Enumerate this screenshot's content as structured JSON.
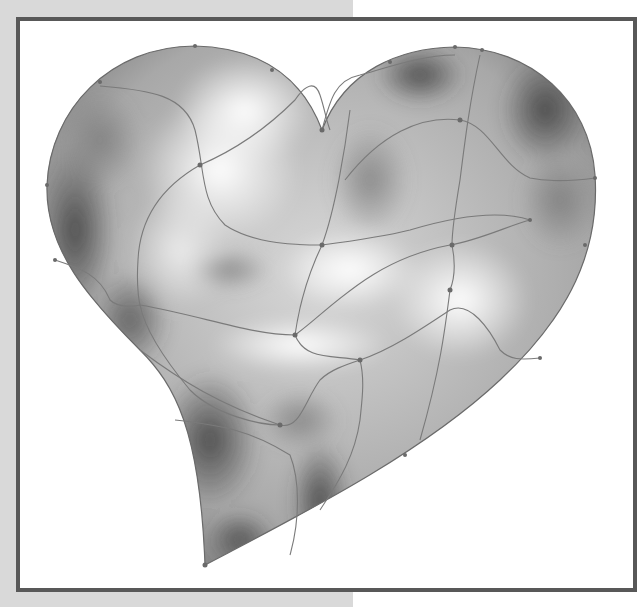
{
  "artwork": {
    "subject": "gradient mesh heart",
    "style": "grayscale mesh illustration",
    "colors": {
      "background_gray": "#d9d9d9",
      "frame_border": "#585858",
      "frame_fill": "#ffffff",
      "mesh_line": "#7a7a7a",
      "mesh_node": "#6a6a6a",
      "shade_dark": "#4a4a4a",
      "shade_mid": "#9a9a9a",
      "highlight": "#ffffff"
    }
  }
}
